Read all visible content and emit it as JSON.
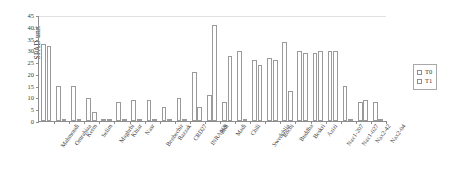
{
  "chart_data": {
    "type": "bar",
    "title": "",
    "xlabel": "",
    "ylabel": "SPAD unit",
    "ylim": [
      0,
      45
    ],
    "yticks": [
      0,
      5,
      10,
      15,
      20,
      25,
      30,
      35,
      40,
      45
    ],
    "grid": false,
    "legend_position": "right",
    "categories": [
      "Mahmoudi",
      "Omrabiaa",
      "Kerm",
      "Selim",
      "Maghrbi",
      "Khiar",
      "Nasr",
      "Benbechir",
      "Razzak",
      "CRD27",
      "INRA169",
      "Bidi",
      "Madi",
      "Chili",
      "Swedchlia",
      "Rochi",
      "Buddha",
      "Beskri",
      "Azizi",
      "Nax1-207",
      "Nax1-027",
      "Nax2-42",
      "Nax2-04"
    ],
    "series": [
      {
        "name": "T0",
        "color": "#ffffff",
        "edge_color": "#9a9a9a",
        "values": [
          33,
          15,
          15,
          10,
          1,
          8,
          9,
          9,
          6,
          10,
          21,
          11,
          8,
          30,
          26,
          27,
          34,
          30,
          29,
          30,
          15,
          8,
          8
        ]
      },
      {
        "name": "T1",
        "color": "#ffffff",
        "edge_color": "#9a9a9a",
        "values": [
          32,
          0.6,
          0.3,
          4,
          0.3,
          0.3,
          0.3,
          1,
          0.3,
          0.3,
          6,
          41,
          28,
          1,
          24,
          26,
          13,
          29,
          30,
          30,
          1,
          9,
          0.3
        ]
      }
    ]
  },
  "legend": {
    "items": [
      {
        "label": "T0"
      },
      {
        "label": "T1"
      }
    ]
  }
}
